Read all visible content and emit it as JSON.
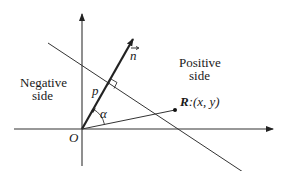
{
  "diagram": {
    "labels": {
      "negative_line1": "Negative",
      "negative_line2": "side",
      "positive_line1": "Positive",
      "positive_line2": "side",
      "normal_vector": "n",
      "distance": "p",
      "angle": "α",
      "origin": "O",
      "point_bold": "R",
      "point_coords": ":(x, y)"
    },
    "colors": {
      "stroke": "#222222",
      "background": "#ffffff"
    }
  }
}
